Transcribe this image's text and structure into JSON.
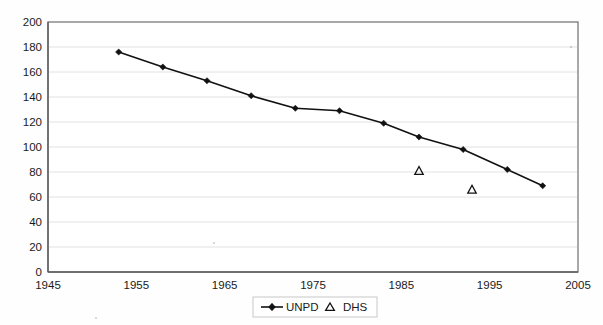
{
  "chart_data": {
    "type": "line",
    "title": "",
    "xlabel": "",
    "ylabel": "",
    "xlim": [
      1945,
      2005
    ],
    "ylim": [
      0,
      200
    ],
    "grid": true,
    "legend_position": "bottom-center",
    "x_ticks": [
      "1945",
      "1955",
      "1965",
      "1975",
      "1985",
      "1995",
      "2005"
    ],
    "x_tick_values": [
      1945,
      1955,
      1965,
      1975,
      1985,
      1995,
      2005
    ],
    "y_ticks": [
      "0",
      "20",
      "40",
      "60",
      "80",
      "100",
      "120",
      "140",
      "160",
      "180",
      "200"
    ],
    "y_tick_values": [
      0,
      20,
      40,
      60,
      80,
      100,
      120,
      140,
      160,
      180,
      200
    ],
    "series": [
      {
        "name": "UNPD",
        "marker": "diamond",
        "style": "line-with-markers",
        "color": "#111111",
        "x": [
          1953,
          1958,
          1963,
          1968,
          1973,
          1978,
          1983,
          1987,
          1992,
          1997,
          2001
        ],
        "values": [
          176,
          164,
          153,
          141,
          131,
          129,
          119,
          108,
          98,
          82,
          69
        ]
      },
      {
        "name": "DHS",
        "marker": "triangle",
        "style": "markers-only",
        "color": "#111111",
        "x": [
          1987,
          1993
        ],
        "values": [
          81,
          66
        ]
      }
    ]
  },
  "legend": {
    "entries": [
      {
        "label": "UNPD",
        "marker": "line-diamond-marker"
      },
      {
        "label": "DHS",
        "marker": "triangle-marker"
      }
    ]
  }
}
